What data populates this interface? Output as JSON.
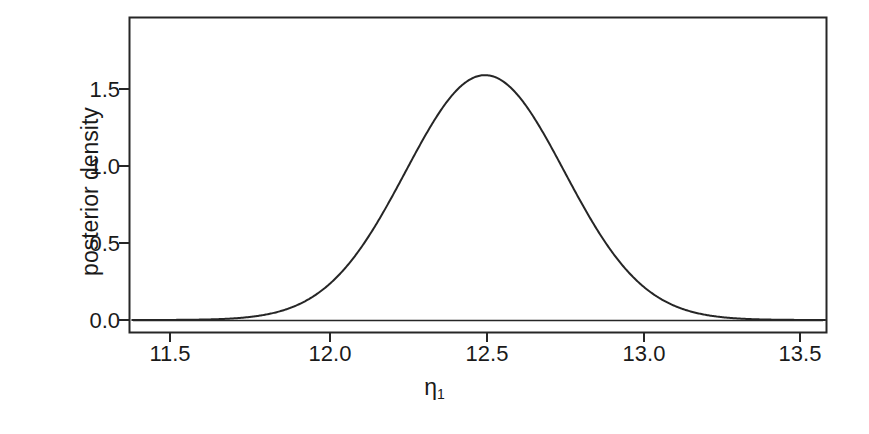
{
  "figure": {
    "background_color": "#ffffff",
    "line_color": "#262626",
    "frame_color": "#262626"
  },
  "axes": {
    "x_title": "η",
    "x_title_subscript": "1",
    "y_title": "posterior density",
    "x_ticks": [
      "11.5",
      "12.0",
      "12.5",
      "13.0",
      "13.5"
    ],
    "y_ticks": [
      "0.0",
      "0.5",
      "1.0",
      "1.5"
    ]
  },
  "chart_data": {
    "type": "line",
    "title": "",
    "subtitle": "",
    "xlabel": "η₁",
    "ylabel": "posterior density",
    "xlim": [
      11.38,
      13.58
    ],
    "ylim": [
      -0.04,
      1.83
    ],
    "xticks": [
      11.5,
      12.0,
      12.5,
      13.0,
      13.5
    ],
    "yticks": [
      0.0,
      0.5,
      1.0,
      1.5
    ],
    "grid": false,
    "legend": null,
    "annotations": [],
    "series": [
      {
        "name": "posterior density",
        "color": "#262626",
        "peak_x": 12.5,
        "peak_y": 1.59,
        "x": [
          11.4,
          11.45,
          11.5,
          11.55,
          11.6,
          11.65,
          11.7,
          11.75,
          11.8,
          11.85,
          11.9,
          11.95,
          12.0,
          12.05,
          12.1,
          12.15,
          12.2,
          12.25,
          12.3,
          12.35,
          12.4,
          12.45,
          12.5,
          12.55,
          12.6,
          12.65,
          12.7,
          12.75,
          12.8,
          12.85,
          12.9,
          12.95,
          13.0,
          13.05,
          13.1,
          13.15,
          13.2,
          13.25,
          13.3,
          13.35,
          13.4,
          13.45,
          13.5,
          13.55
        ],
        "y": [
          0.0,
          0.0,
          0.001,
          0.002,
          0.005,
          0.01,
          0.021,
          0.039,
          0.069,
          0.115,
          0.182,
          0.274,
          0.392,
          0.535,
          0.697,
          0.867,
          1.031,
          1.178,
          1.322,
          1.447,
          1.533,
          1.582,
          1.59,
          1.582,
          1.533,
          1.447,
          1.322,
          1.178,
          1.031,
          0.867,
          0.697,
          0.535,
          0.392,
          0.274,
          0.182,
          0.115,
          0.069,
          0.039,
          0.021,
          0.01,
          0.005,
          0.002,
          0.001,
          0.0
        ],
        "baseline_y": 0.0,
        "distribution": "normal-like",
        "mean": 12.5,
        "approx_sd": 0.252
      }
    ]
  }
}
